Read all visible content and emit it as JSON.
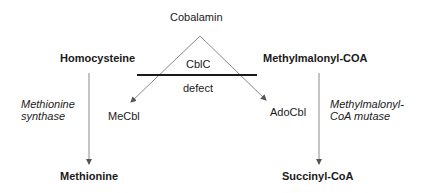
{
  "diagram": {
    "top": {
      "cofactor": "Cobalamin"
    },
    "defect": {
      "top_label": "CblC",
      "bottom_label": "defect"
    },
    "left_pathway": {
      "substrate": "Homocysteine",
      "enzyme_line1": "Methionine",
      "enzyme_line2": "synthase",
      "cofactor": "MeCbl",
      "product": "Methionine"
    },
    "right_pathway": {
      "substrate": "Methylmalonyl-COA",
      "enzyme_line1": "Methylmalonyl-",
      "enzyme_line2": "CoA mutase",
      "cofactor": "AdoCbl",
      "product": "Succinyl-CoA"
    },
    "colors": {
      "line": "#7a7a7a",
      "bar": "#1a1a1a",
      "text": "#1a1a1a"
    }
  }
}
